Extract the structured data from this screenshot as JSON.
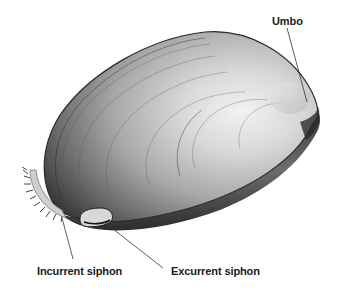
{
  "diagram": {
    "labels": [
      {
        "id": "umbo",
        "text": "Umbo"
      },
      {
        "id": "incurrent",
        "text": "Incurrent siphon"
      },
      {
        "id": "excurrent",
        "text": "Excurrent siphon"
      }
    ],
    "colors": {
      "background": "#ffffff",
      "shell_dark": "#2a2a2a",
      "shell_mid": "#8a8a8a",
      "shell_light": "#e6e6e6",
      "label_text": "#1a1a1a",
      "leader_line": "#333333"
    }
  }
}
